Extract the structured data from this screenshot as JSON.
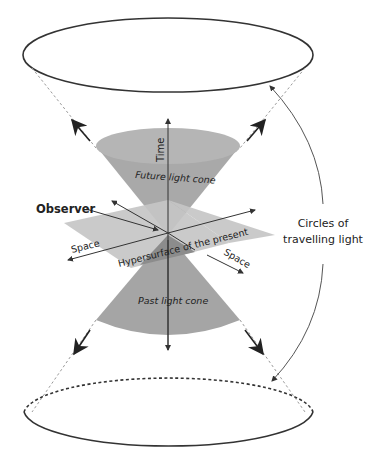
{
  "diagram": {
    "labels": {
      "time": "Time",
      "future_cone": "Future light cone",
      "past_cone": "Past light cone",
      "observer": "Observer",
      "space_left": "Space",
      "space_right": "Space",
      "hypersurface": "Hypersurface of the present",
      "circles_line1": "Circles of",
      "circles_line2": "travelling light"
    },
    "colors": {
      "cone": "#a9a9a9",
      "cone_top": "#b8b8b8",
      "plane": "#c4c4c4",
      "plane_overlap": "#8f8f8f",
      "stroke": "#333333",
      "dashed": "#999999"
    }
  }
}
